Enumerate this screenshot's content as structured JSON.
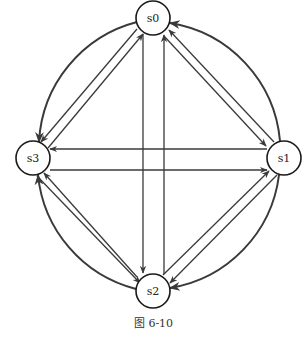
{
  "figure": {
    "caption": "图 6-10",
    "colors": {
      "stroke": "#3a3a3a",
      "node_stroke": "#1a1a1a",
      "background": "#ffffff"
    }
  },
  "nodes": [
    {
      "id": "s0",
      "label": "s0",
      "cx": 153,
      "cy": 18
    },
    {
      "id": "s1",
      "label": "s1",
      "cx": 284,
      "cy": 158
    },
    {
      "id": "s2",
      "label": "s2",
      "cx": 153,
      "cy": 291
    },
    {
      "id": "s3",
      "label": "s3",
      "cx": 33,
      "cy": 158
    }
  ],
  "edges": [
    {
      "from": "s0",
      "to": "s2",
      "kind": "straight"
    },
    {
      "from": "s2",
      "to": "s0",
      "kind": "straight"
    },
    {
      "from": "s1",
      "to": "s3",
      "kind": "straight"
    },
    {
      "from": "s3",
      "to": "s1",
      "kind": "straight"
    },
    {
      "from": "s0",
      "to": "s3",
      "kind": "straight"
    },
    {
      "from": "s3",
      "to": "s0",
      "kind": "straight"
    },
    {
      "from": "s0",
      "to": "s1",
      "kind": "straight"
    },
    {
      "from": "s1",
      "to": "s0",
      "kind": "straight"
    },
    {
      "from": "s3",
      "to": "s2",
      "kind": "straight"
    },
    {
      "from": "s2",
      "to": "s3",
      "kind": "straight"
    },
    {
      "from": "s1",
      "to": "s2",
      "kind": "straight"
    },
    {
      "from": "s2",
      "to": "s1",
      "kind": "straight"
    },
    {
      "from": "s0",
      "to": "s3",
      "kind": "arc"
    },
    {
      "from": "s1",
      "to": "s0",
      "kind": "arc"
    },
    {
      "from": "s2",
      "to": "s3",
      "kind": "arc"
    },
    {
      "from": "s1",
      "to": "s2",
      "kind": "arc"
    }
  ]
}
